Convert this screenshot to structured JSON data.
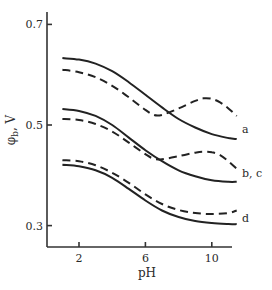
{
  "chart_data": {
    "type": "line",
    "title": "",
    "xlabel": "pH",
    "ylabel": "φ",
    "ylabel_sub": "b",
    "ylabel_unit": ", V",
    "xlim": [
      0,
      12
    ],
    "ylim": [
      0.26,
      0.72
    ],
    "xticks": [
      2,
      6,
      10
    ],
    "yticks": [
      0.3,
      0.5,
      0.7
    ],
    "xtick_labels": [
      "2",
      "6",
      "10"
    ],
    "ytick_labels": [
      "0.3",
      "0.5",
      "0.7"
    ],
    "grid": false,
    "legend": "inline curve labels at right ends",
    "curve_labels": [
      {
        "text": "a",
        "series": [
          "a-solid",
          "a-dashed"
        ]
      },
      {
        "text": "b, c",
        "series": [
          "bc-solid",
          "bc-dashed"
        ]
      },
      {
        "text": "d",
        "series": [
          "d-solid",
          "d-dashed"
        ]
      }
    ],
    "series": [
      {
        "name": "a-solid",
        "style": "solid",
        "x": [
          1,
          2,
          3,
          4,
          5,
          6,
          7,
          8,
          9,
          10,
          11,
          11.5
        ],
        "y": [
          0.633,
          0.63,
          0.622,
          0.607,
          0.585,
          0.56,
          0.535,
          0.512,
          0.495,
          0.482,
          0.474,
          0.472
        ]
      },
      {
        "name": "a-dashed",
        "style": "dashed",
        "x": [
          1,
          2,
          3,
          4,
          5,
          6,
          6.5,
          7,
          8,
          9,
          9.5,
          10,
          10.5,
          11,
          11.5
        ],
        "y": [
          0.61,
          0.605,
          0.595,
          0.578,
          0.555,
          0.53,
          0.52,
          0.52,
          0.533,
          0.548,
          0.553,
          0.552,
          0.545,
          0.533,
          0.518
        ]
      },
      {
        "name": "bc-solid",
        "style": "solid",
        "x": [
          1,
          2,
          3,
          4,
          5,
          6,
          7,
          8,
          9,
          10,
          11,
          11.5
        ],
        "y": [
          0.532,
          0.528,
          0.518,
          0.5,
          0.475,
          0.45,
          0.428,
          0.41,
          0.398,
          0.39,
          0.387,
          0.387
        ]
      },
      {
        "name": "bc-dashed",
        "style": "dashed",
        "x": [
          1,
          2,
          3,
          4,
          5,
          6,
          6.5,
          7,
          8,
          9,
          9.5,
          10,
          10.5,
          11,
          11.5
        ],
        "y": [
          0.512,
          0.51,
          0.502,
          0.487,
          0.465,
          0.442,
          0.433,
          0.432,
          0.438,
          0.445,
          0.447,
          0.446,
          0.44,
          0.428,
          0.413
        ]
      },
      {
        "name": "d-dashed",
        "style": "dashed",
        "x": [
          1,
          2,
          3,
          4,
          5,
          6,
          7,
          8,
          9,
          10,
          11,
          11.5
        ],
        "y": [
          0.43,
          0.428,
          0.42,
          0.405,
          0.385,
          0.362,
          0.343,
          0.331,
          0.325,
          0.323,
          0.325,
          0.33
        ]
      },
      {
        "name": "d-solid",
        "style": "solid",
        "x": [
          1,
          2,
          3,
          4,
          5,
          6,
          7,
          8,
          9,
          10,
          11,
          11.5
        ],
        "y": [
          0.421,
          0.418,
          0.41,
          0.395,
          0.373,
          0.35,
          0.33,
          0.317,
          0.309,
          0.305,
          0.303,
          0.303
        ]
      }
    ]
  }
}
